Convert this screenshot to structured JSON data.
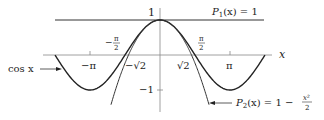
{
  "chart_data": {
    "type": "line",
    "title": "",
    "xlabel": "x",
    "ylabel": "",
    "xlim": [
      -4.712,
      5.0
    ],
    "ylim": [
      -1.3,
      1.2
    ],
    "grid": false,
    "x_ticks": [
      {
        "value": -3.1416,
        "label": "−π"
      },
      {
        "value": -1.5708,
        "label": "−π/2"
      },
      {
        "value": -1.4142,
        "label": "−√2"
      },
      {
        "value": 1.4142,
        "label": "√2"
      },
      {
        "value": 1.5708,
        "label": "π/2"
      },
      {
        "value": 3.1416,
        "label": "π"
      }
    ],
    "y_ticks": [
      {
        "value": 1,
        "label": "1"
      },
      {
        "value": -1,
        "label": "−1"
      }
    ],
    "series": [
      {
        "name": "cos x",
        "function": "cos(x)",
        "domain": [
          -4.712,
          4.712
        ],
        "color": "#222222"
      },
      {
        "name": "P1(x) = 1",
        "function": "1",
        "domain": [
          -4.712,
          6.4
        ],
        "color": "#222222"
      },
      {
        "name": "P2(x) = 1 − x²/2",
        "function": "1 - x^2/2",
        "domain": [
          -2.2,
          2.2
        ],
        "color": "#222222"
      }
    ],
    "annotations": [
      {
        "text": "cos x",
        "arrow_to": "cos curve at x≈-3.9"
      },
      {
        "text": "P1(x) = 1",
        "position": "top right above line"
      },
      {
        "text": "P2(x) = 1 − x²/2",
        "arrow_to": "end of parabola at x≈2.2"
      }
    ]
  },
  "labels": {
    "x_axis": "x",
    "one": "1",
    "neg_one": "−1",
    "neg_pi": "−π",
    "pi": "π",
    "pi_half_num": "π",
    "pi_half_den": "2",
    "neg_sign": "−",
    "sqrt2": "√2",
    "neg_sqrt2": "−√2",
    "cos": "cos x",
    "p1": "P",
    "p1_sub": "1",
    "p1_rest": "(x) = 1",
    "p2": "P",
    "p2_sub": "2",
    "p2_rest": "(x) = 1 −",
    "p2_frac_num": "x²",
    "p2_frac_den": "2"
  }
}
